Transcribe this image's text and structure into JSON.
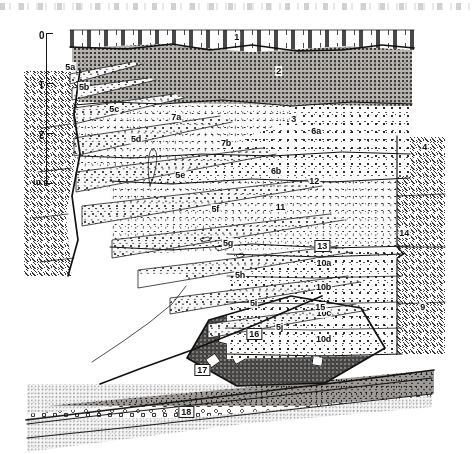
{
  "figure": {
    "kind": "geologic-trench-cross-section",
    "orientation_note": "plate reproduced upside-down (rotated 180 degrees)",
    "scale_bar": {
      "label_unit": "m",
      "ticks": [
        "0",
        "1",
        "2",
        "3"
      ],
      "unit_suffix": "3 m"
    }
  },
  "units": [
    {
      "id": "1",
      "label": "1",
      "description": "topsoil / A-horizon with dash-and-tee ornament"
    },
    {
      "id": "2",
      "label": "2",
      "description": "dark silty colluvium, dense fine stipple"
    },
    {
      "id": "3",
      "label": "3",
      "description": "gravelly sand"
    },
    {
      "id": "4",
      "label": "4",
      "description": "fractured bedrock, diagonal dash hatch"
    },
    {
      "id": "5a",
      "label": "5a",
      "description": "fissure-fill wedge"
    },
    {
      "id": "5b",
      "label": "5b",
      "description": "fissure-fill wedge"
    },
    {
      "id": "5c",
      "label": "5c",
      "description": "fissure-fill wedge"
    },
    {
      "id": "5d",
      "label": "5d",
      "description": "fissure-fill wedge"
    },
    {
      "id": "5e",
      "label": "5e",
      "description": "fissure-fill wedge"
    },
    {
      "id": "5f",
      "label": "5f",
      "description": "fissure-fill wedge"
    },
    {
      "id": "5g",
      "label": "5g",
      "description": "fissure-fill wedge"
    },
    {
      "id": "5h",
      "label": "5h",
      "description": "fissure-fill wedge"
    },
    {
      "id": "5i",
      "label": "5i",
      "description": "fissure-fill wedge"
    },
    {
      "id": "5j",
      "label": "5j",
      "description": "fissure-fill wedge"
    },
    {
      "id": "6a",
      "label": "6a",
      "description": "gravelly sand subunit a"
    },
    {
      "id": "6b",
      "label": "6b",
      "description": "gravelly sand subunit b"
    },
    {
      "id": "7a",
      "label": "7a",
      "description": "gravelly sand subunit a"
    },
    {
      "id": "7b",
      "label": "7b",
      "description": "gravelly sand subunit b"
    },
    {
      "id": "9",
      "label": "9",
      "description": "bedrock block, diagonal hatch"
    },
    {
      "id": "10a",
      "label": "10a",
      "description": "gravel subunit a"
    },
    {
      "id": "10b",
      "label": "10b",
      "description": "gravel subunit b"
    },
    {
      "id": "10c",
      "label": "10c",
      "description": "gravel subunit c"
    },
    {
      "id": "10d",
      "label": "10d",
      "description": "gravel subunit d"
    },
    {
      "id": "11",
      "label": "11",
      "description": "contact / fault trace marker"
    },
    {
      "id": "12",
      "label": "12",
      "description": "contact / fault trace marker"
    },
    {
      "id": "13",
      "label": "13",
      "description": "clast-rich diamict, dark matrix with white clasts"
    },
    {
      "id": "14",
      "label": "14",
      "description": "bedrock, diagonal hatch"
    },
    {
      "id": "15",
      "label": "15",
      "description": "open void / unornamented zone"
    },
    {
      "id": "16",
      "label": "16",
      "description": "dark coarse gravel band"
    },
    {
      "id": "17",
      "label": "17",
      "description": "open pebbly lag"
    },
    {
      "id": "18",
      "label": "18",
      "description": "laminated sand with streak ornament"
    }
  ],
  "colors": {
    "ink": "#111111",
    "paper": "#ffffff",
    "dark_silt": "#b7b4b0",
    "dark_gravel": "#9d9a97",
    "diamict_matrix": "#4d4b4a",
    "clast": "#fefefe"
  }
}
